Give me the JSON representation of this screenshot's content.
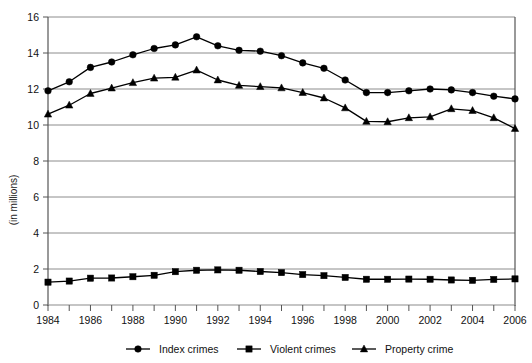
{
  "chart_data": {
    "type": "line",
    "title": "",
    "xlabel": "",
    "ylabel": "(in millions)",
    "xlim": [
      1984,
      2006
    ],
    "ylim": [
      0,
      16
    ],
    "yticks": [
      0,
      2,
      4,
      6,
      8,
      10,
      12,
      14,
      16
    ],
    "xticks": [
      1984,
      1985,
      1986,
      1987,
      1988,
      1989,
      1990,
      1991,
      1992,
      1993,
      1994,
      1995,
      1996,
      1997,
      1998,
      1999,
      2000,
      2001,
      2002,
      2003,
      2004,
      2005,
      2006
    ],
    "xtick_labels": [
      "1984",
      "",
      "1986",
      "",
      "1988",
      "",
      "1990",
      "",
      "1992",
      "",
      "1994",
      "",
      "1996",
      "",
      "1998",
      "",
      "2000",
      "",
      "2002",
      "",
      "2004",
      "",
      "2006"
    ],
    "grid": "horizontal",
    "legend_position": "bottom",
    "x": [
      1984,
      1985,
      1986,
      1987,
      1988,
      1989,
      1990,
      1991,
      1992,
      1993,
      1994,
      1995,
      1996,
      1997,
      1998,
      1999,
      2000,
      2001,
      2002,
      2003,
      2004,
      2005,
      2006
    ],
    "series": [
      {
        "name": "Index crimes",
        "marker": "circle",
        "color": "#000000",
        "values": [
          11.9,
          12.4,
          13.2,
          13.5,
          13.9,
          14.25,
          14.45,
          14.9,
          14.4,
          14.15,
          14.1,
          13.85,
          13.45,
          13.15,
          12.5,
          11.8,
          11.8,
          11.9,
          12.0,
          11.95,
          11.8,
          11.6,
          11.45
        ]
      },
      {
        "name": "Violent crimes",
        "marker": "square",
        "color": "#000000",
        "values": [
          1.27,
          1.33,
          1.49,
          1.5,
          1.57,
          1.65,
          1.85,
          1.93,
          1.95,
          1.93,
          1.86,
          1.8,
          1.69,
          1.63,
          1.53,
          1.43,
          1.43,
          1.44,
          1.43,
          1.39,
          1.37,
          1.42,
          1.45
        ]
      },
      {
        "name": "Property crime",
        "marker": "triangle",
        "color": "#000000",
        "values": [
          10.6,
          11.1,
          11.75,
          12.05,
          12.35,
          12.6,
          12.65,
          13.05,
          12.5,
          12.2,
          12.13,
          12.06,
          11.8,
          11.5,
          10.95,
          10.2,
          10.18,
          10.4,
          10.45,
          10.9,
          10.8,
          10.4,
          9.8
        ]
      }
    ]
  },
  "legend": {
    "items": [
      {
        "label": "Index crimes",
        "marker": "circle"
      },
      {
        "label": "Violent crimes",
        "marker": "square"
      },
      {
        "label": "Property crime",
        "marker": "triangle"
      }
    ]
  },
  "axis": {
    "ylabel": "(in millions)"
  }
}
